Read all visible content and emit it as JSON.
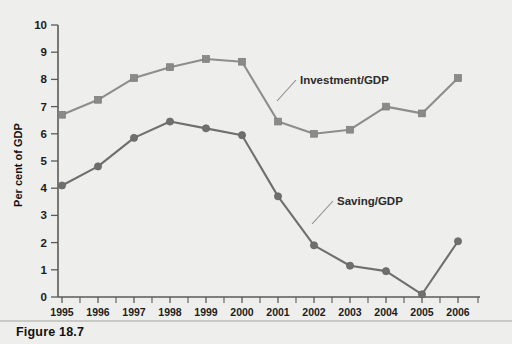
{
  "figure": {
    "caption": "Figure 18.7"
  },
  "chart_data": {
    "type": "line",
    "title": "",
    "xlabel": "",
    "ylabel": "Per cent of GDP",
    "categories": [
      "1995",
      "1996",
      "1997",
      "1998",
      "1999",
      "2000",
      "2001",
      "2002",
      "2003",
      "2004",
      "2005",
      "2006"
    ],
    "xlim": [
      "1995",
      "2006"
    ],
    "ylim": [
      0,
      10
    ],
    "ytick_labels": [
      "0",
      "1",
      "2",
      "3",
      "4",
      "5",
      "6",
      "7",
      "8",
      "9",
      "10"
    ],
    "ytick_values": [
      0,
      1,
      2,
      3,
      4,
      5,
      6,
      7,
      8,
      9,
      10
    ],
    "grid": false,
    "legend_position": "inline-annotation",
    "series": [
      {
        "name": "Investment/GDP",
        "marker": "square",
        "color": "#8a8a8a",
        "values": [
          6.7,
          7.25,
          8.05,
          8.45,
          8.75,
          8.65,
          6.45,
          6.0,
          6.15,
          7.0,
          6.75,
          8.05
        ]
      },
      {
        "name": "Saving/GDP",
        "marker": "circle",
        "color": "#6f6f6f",
        "values": [
          4.1,
          4.8,
          5.85,
          6.45,
          6.2,
          5.95,
          3.7,
          1.9,
          1.15,
          0.95,
          0.1,
          2.05
        ]
      }
    ],
    "annotations": [
      {
        "text": "Investment/GDP",
        "anchor_category": "2001",
        "series": "Investment/GDP"
      },
      {
        "text": "Saving/GDP",
        "anchor_category": "2001",
        "series": "Saving/GDP"
      }
    ]
  },
  "colors": {
    "background": "#eeeeec",
    "axis": "#5a5a5a",
    "investment": "#8a8a8a",
    "saving": "#6f6f6f",
    "text": "#111111"
  }
}
